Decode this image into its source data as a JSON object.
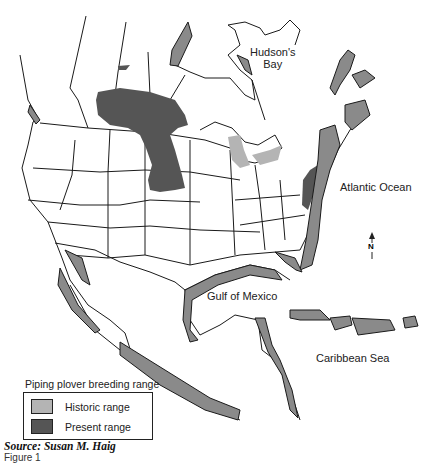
{
  "map": {
    "labels": {
      "hudsons_bay_line1": "Hudson's",
      "hudsons_bay_line2": "Bay",
      "atlantic": "Atlantic Ocean",
      "gulf": "Gulf of Mexico",
      "caribbean": "Caribbean Sea",
      "north": "N"
    },
    "colors": {
      "historic": "#b4b4b4",
      "present": "#555555",
      "coast_band": "#8a8a8a",
      "outline": "#1a1a1a"
    }
  },
  "legend": {
    "title": "Piping plover breeding range",
    "items": [
      {
        "label": "Historic range",
        "color": "#b4b4b4"
      },
      {
        "label": "Present range",
        "color": "#555555"
      }
    ]
  },
  "caption": {
    "source": "Source: Susan M. Haig",
    "figure": "Figure 1"
  }
}
